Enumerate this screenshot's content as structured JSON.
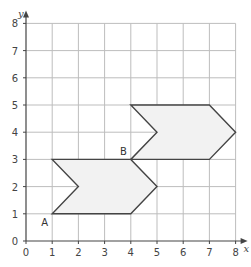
{
  "diagram": {
    "type": "coordinate-grid-translation",
    "axes": {
      "x": {
        "label": "x",
        "min": 0,
        "max": 8,
        "ticks": [
          "0",
          "1",
          "2",
          "3",
          "4",
          "5",
          "6",
          "7",
          "8"
        ]
      },
      "y": {
        "label": "y",
        "min": 0,
        "max": 8,
        "ticks": [
          "0",
          "1",
          "2",
          "3",
          "4",
          "5",
          "6",
          "7",
          "8"
        ]
      }
    },
    "shapes": [
      {
        "name": "shape-A",
        "vertices": [
          [
            1,
            1
          ],
          [
            4,
            1
          ],
          [
            5,
            2
          ],
          [
            4,
            3
          ],
          [
            1,
            3
          ],
          [
            2,
            2
          ]
        ],
        "fill": "#f2f2f2",
        "stroke": "#444444"
      },
      {
        "name": "shape-B",
        "vertices": [
          [
            4,
            3
          ],
          [
            7,
            3
          ],
          [
            8,
            4
          ],
          [
            7,
            5
          ],
          [
            4,
            5
          ],
          [
            5,
            4
          ]
        ],
        "fill": "#f2f2f2",
        "stroke": "#444444"
      }
    ],
    "points": [
      {
        "label": "A",
        "x": 1,
        "y": 1
      },
      {
        "label": "B",
        "x": 4,
        "y": 3
      }
    ],
    "colors": {
      "grid": "#bdbdbd",
      "axis": "#444444",
      "outline": "#444444",
      "fill": "#f2f2f2"
    }
  }
}
